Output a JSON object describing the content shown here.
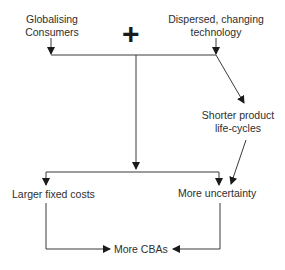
{
  "diagram": {
    "nodes": {
      "globalising_consumers": {
        "line1": "Globalising",
        "line2": "Consumers"
      },
      "dispersed_technology": {
        "line1": "Dispersed, changing",
        "line2": "technology"
      },
      "combine_symbol": "+",
      "shorter_lifecycles": {
        "line1": "Shorter product",
        "line2": "life-cycles"
      },
      "larger_fixed_costs": "Larger fixed costs",
      "more_uncertainty": "More uncertainty",
      "more_cbas": "More CBAs"
    },
    "edges": [
      {
        "from": "Globalising Consumers",
        "to": "junction"
      },
      {
        "from": "Dispersed, changing technology",
        "to": "junction"
      },
      {
        "from": "Dispersed, changing technology",
        "to": "Shorter product life-cycles"
      },
      {
        "from": "junction",
        "to": "Larger fixed costs"
      },
      {
        "from": "junction",
        "to": "More uncertainty"
      },
      {
        "from": "Shorter product life-cycles",
        "to": "More uncertainty"
      },
      {
        "from": "Larger fixed costs",
        "to": "More CBAs"
      },
      {
        "from": "More uncertainty",
        "to": "More CBAs"
      }
    ],
    "colors": {
      "line": "#3a3a3a",
      "text": "#2e2e2e"
    }
  }
}
